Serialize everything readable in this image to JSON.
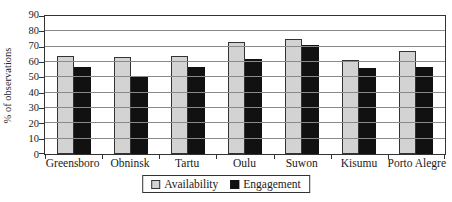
{
  "chart_data": {
    "type": "bar",
    "title": "",
    "xlabel": "",
    "ylabel": "% of observations",
    "ylim": [
      0,
      90
    ],
    "yticks": [
      0,
      10,
      20,
      30,
      40,
      50,
      60,
      70,
      80,
      90
    ],
    "grid": "horizontal",
    "legend_position": "bottom",
    "categories": [
      "Greensboro",
      "Obninsk",
      "Tartu",
      "Oulu",
      "Suwon",
      "Kisumu",
      "Porto Alegre"
    ],
    "series": [
      {
        "name": "Availability",
        "color": "#d3d3d3",
        "border_color": "#333333",
        "values": [
          64,
          63,
          64,
          73,
          75,
          61,
          67
        ]
      },
      {
        "name": "Engagement",
        "color": "#111111",
        "border_color": "#111111",
        "values": [
          57,
          51,
          57,
          62,
          71,
          56,
          57
        ]
      }
    ]
  },
  "colors": {
    "axis": "#333333",
    "gridline": "#8a8a8a",
    "background": "#ffffff"
  }
}
